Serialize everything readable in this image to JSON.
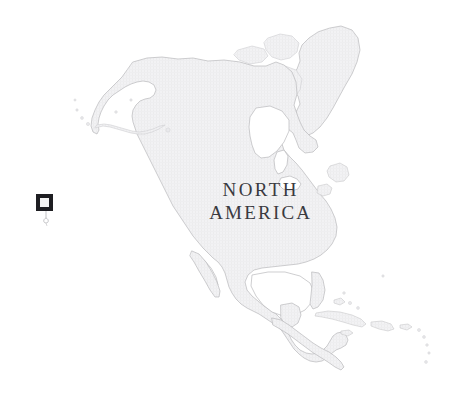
{
  "map": {
    "title": "North America",
    "label": {
      "line1": "NORTH",
      "line2": "AMERICA"
    },
    "projection_note": "",
    "background_color": "#ffffff",
    "land_fill_color": "#f1f1f3",
    "land_stroke_color": "#b9b9bc",
    "label_color": "#3a3a40",
    "marker": {
      "name": "map-location-marker",
      "outer_color": "#1e1e22",
      "inner_color": "#f4f4f4",
      "x": 36,
      "y": 194,
      "size": 17
    },
    "regions": [
      {
        "name": "Alaska"
      },
      {
        "name": "Aleutian Islands"
      },
      {
        "name": "Canada"
      },
      {
        "name": "Canadian Arctic Archipelago"
      },
      {
        "name": "Greenland"
      },
      {
        "name": "Hudson Bay"
      },
      {
        "name": "United States"
      },
      {
        "name": "Great Lakes"
      },
      {
        "name": "Baja California"
      },
      {
        "name": "Gulf of Mexico"
      },
      {
        "name": "Mexico"
      },
      {
        "name": "Yucatan Peninsula"
      },
      {
        "name": "Central America"
      },
      {
        "name": "Cuba"
      },
      {
        "name": "Hispaniola"
      },
      {
        "name": "Puerto Rico"
      },
      {
        "name": "Lesser Antilles"
      },
      {
        "name": "Bahamas"
      },
      {
        "name": "Newfoundland"
      },
      {
        "name": "Baffin Island"
      }
    ]
  }
}
